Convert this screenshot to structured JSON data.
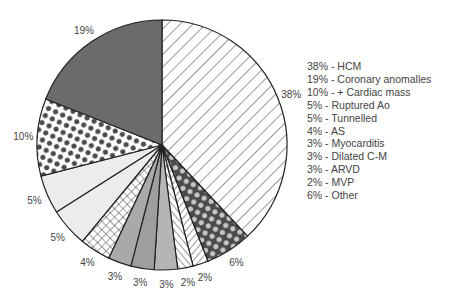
{
  "chart_data": {
    "type": "pie",
    "title": "",
    "start_angle_deg": 0,
    "direction": "clockwise",
    "slices": [
      {
        "label": "HCM",
        "value": 38,
        "display": "38%",
        "fill": "hatch-fwd",
        "color": "#ffffff"
      },
      {
        "label": "Other",
        "value": 6,
        "display": "6%",
        "fill": "dots-light-on-dark",
        "color": "#4a4a4a"
      },
      {
        "label": "MVP",
        "value": 2,
        "display": "2%",
        "fill": "hatch-fwd-dense",
        "color": "#ffffff"
      },
      {
        "label": "",
        "value": 2,
        "display": "2%",
        "fill": "hatch-back-dense",
        "color": "#ffffff"
      },
      {
        "label": "ARVD",
        "value": 3,
        "display": "3%",
        "fill": "solid",
        "color": "#b5b5b5"
      },
      {
        "label": "Dilated C-M",
        "value": 3,
        "display": "3%",
        "fill": "solid",
        "color": "#9e9e9e"
      },
      {
        "label": "Myocarditis",
        "value": 3,
        "display": "3%",
        "fill": "solid",
        "color": "#a9a9a9"
      },
      {
        "label": "AS",
        "value": 4,
        "display": "4%",
        "fill": "crosshatch",
        "color": "#ffffff"
      },
      {
        "label": "Tunnelled",
        "value": 5,
        "display": "5%",
        "fill": "solid",
        "color": "#ececec"
      },
      {
        "label": "Ruptured Ao",
        "value": 5,
        "display": "5%",
        "fill": "solid",
        "color": "#ececec"
      },
      {
        "label": "+ Cardiac mass",
        "value": 10,
        "display": "10%",
        "fill": "dots-dark-on-light",
        "color": "#ffffff"
      },
      {
        "label": "Coronary anomalles",
        "value": 19,
        "display": "19%",
        "fill": "solid",
        "color": "#6b6b6b"
      }
    ],
    "legend_position": "right",
    "legend": [
      "38% - HCM",
      "19% - Coronary anomalles",
      "10% - + Cardiac mass",
      "5% - Ruptured Ao",
      "5% - Tunnelled",
      "4% - AS",
      "3% - Myocarditis",
      "3% - Dilated C-M",
      "3% - ARVD",
      "2% - MVP",
      "6% - Other"
    ]
  },
  "legend": {
    "items": [
      "38% - HCM",
      "19% - Coronary anomalles",
      "10% - + Cardiac mass",
      "5% - Ruptured Ao",
      "5% - Tunnelled",
      "4% - AS",
      "3% - Myocarditis",
      "3% - Dilated C-M",
      "3% - ARVD",
      "2% - MVP",
      "6% - Other"
    ]
  }
}
